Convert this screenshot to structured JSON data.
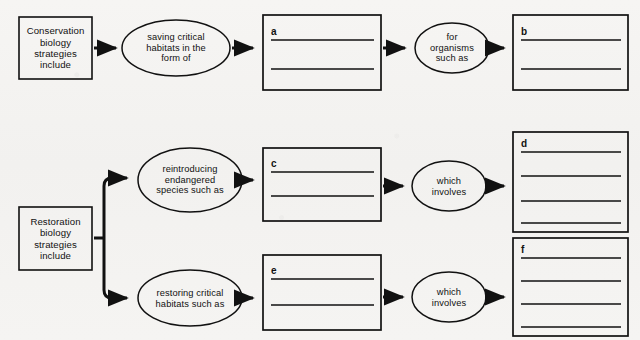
{
  "diagram": {
    "background_color": "#f4f3f1",
    "stroke_color": "#111111",
    "nodes": {
      "conservation_start": {
        "shape": "rectangle",
        "lines": [
          "Conservation",
          "biology",
          "strategies",
          "include"
        ]
      },
      "saving_habitats": {
        "shape": "ellipse",
        "lines": [
          "saving critical",
          "habitats in the",
          "form of"
        ]
      },
      "for_organisms": {
        "shape": "ellipse",
        "lines": [
          "for",
          "organisms",
          "such as"
        ]
      },
      "restoration_start": {
        "shape": "rectangle",
        "lines": [
          "Restoration",
          "biology",
          "strategies",
          "include"
        ]
      },
      "reintroducing_species": {
        "shape": "ellipse",
        "lines": [
          "reintroducing",
          "endangered",
          "species such as"
        ]
      },
      "restoring_habitats": {
        "shape": "ellipse",
        "lines": [
          "restoring critical",
          "habitats such as"
        ]
      },
      "which_involves_upper": {
        "shape": "ellipse",
        "lines": [
          "which",
          "involves"
        ]
      },
      "which_involves_lower": {
        "shape": "ellipse",
        "lines": [
          "which",
          "involves"
        ]
      }
    },
    "answer_boxes": [
      {
        "id": "a",
        "letter": "a",
        "line_count": 2
      },
      {
        "id": "b",
        "letter": "b",
        "line_count": 2
      },
      {
        "id": "c",
        "letter": "c",
        "line_count": 2
      },
      {
        "id": "d",
        "letter": "d",
        "line_count": 4
      },
      {
        "id": "e",
        "letter": "e",
        "line_count": 2
      },
      {
        "id": "f",
        "letter": "f",
        "line_count": 4
      }
    ],
    "flows": [
      {
        "from": "conservation_start",
        "to": "saving_habitats"
      },
      {
        "from": "saving_habitats",
        "to": "a"
      },
      {
        "from": "a",
        "to": "for_organisms"
      },
      {
        "from": "for_organisms",
        "to": "b"
      },
      {
        "from": "restoration_start",
        "to": "reintroducing_species"
      },
      {
        "from": "restoration_start",
        "to": "restoring_habitats"
      },
      {
        "from": "reintroducing_species",
        "to": "c"
      },
      {
        "from": "c",
        "to": "which_involves_upper"
      },
      {
        "from": "which_involves_upper",
        "to": "d"
      },
      {
        "from": "restoring_habitats",
        "to": "e"
      },
      {
        "from": "e",
        "to": "which_involves_lower"
      },
      {
        "from": "which_involves_lower",
        "to": "f"
      }
    ]
  }
}
